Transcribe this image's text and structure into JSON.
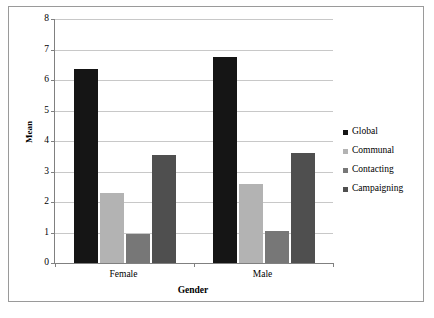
{
  "chart_data": {
    "type": "bar",
    "title": "",
    "xlabel": "Gender",
    "ylabel": "Mean",
    "categories": [
      "Female",
      "Male"
    ],
    "series": [
      {
        "name": "Global",
        "values": [
          6.35,
          6.75
        ],
        "color": "#151515"
      },
      {
        "name": "Communal",
        "values": [
          2.3,
          2.6
        ],
        "color": "#b3b3b3"
      },
      {
        "name": "Contacting",
        "values": [
          0.95,
          1.05
        ],
        "color": "#777777"
      },
      {
        "name": "Campaigning",
        "values": [
          3.55,
          3.6
        ],
        "color": "#4f4f4f"
      }
    ],
    "ylim": [
      0,
      8
    ],
    "yticks": [
      "0",
      "1",
      "2",
      "3",
      "4",
      "5",
      "6",
      "7",
      "8"
    ],
    "grid": true,
    "legend_position": "right",
    "frame": true
  }
}
